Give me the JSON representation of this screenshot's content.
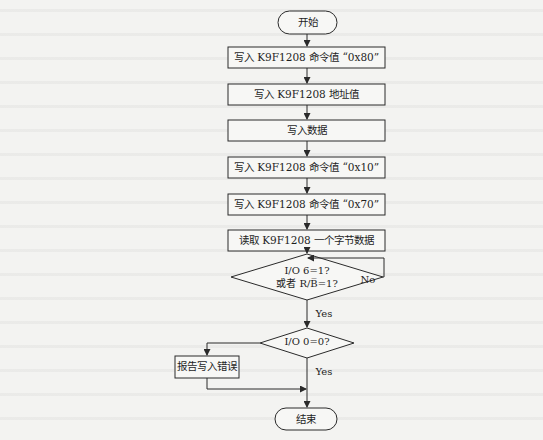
{
  "flowchart": {
    "start": "开始",
    "steps": [
      "写入 K9F1208 命令值 “0x80”",
      "写入 K9F1208 地址值",
      "写入数据",
      "写入 K9F1208 命令值 “0x10”",
      "写入 K9F1208 命令值 “0x70”",
      "读取 K9F1208 一个字节数据"
    ],
    "decision1": {
      "line1": "I/O 6=1?",
      "line2": "或者 R/B̅=1?",
      "no_label": "No",
      "yes_label": "Yes"
    },
    "decision2": {
      "text": "I/O 0=0?",
      "yes_label": "Yes"
    },
    "error_box": "报告写入错误",
    "end": "结束"
  },
  "colors": {
    "line": "#2a2a2a",
    "background": "#f3f3f1"
  }
}
